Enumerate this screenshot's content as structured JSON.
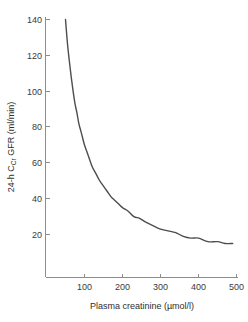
{
  "chart_data": {
    "type": "line",
    "title": "",
    "subtitle": "",
    "xlabel": "Plasma creatinine (µmol/l)",
    "ylabel_parts": {
      "prefix": "24-h C",
      "subscript": "Cr",
      "suffix": " GFR (ml/min)"
    },
    "ylabel": "24-h CCr GFR (ml/min)",
    "xlim": [
      0,
      520
    ],
    "ylim": [
      0,
      148
    ],
    "xticks": [
      100,
      200,
      300,
      400,
      500
    ],
    "xtick_labels": [
      "100",
      "200",
      "300",
      "400",
      "500"
    ],
    "yticks": [
      20,
      40,
      60,
      80,
      100,
      120,
      140
    ],
    "ytick_labels": [
      "20",
      "40",
      "60",
      "80",
      "100",
      "120",
      "140"
    ],
    "grid": false,
    "legend": "none",
    "series": [
      {
        "name": "24-h C_Cr GFR vs plasma creatinine",
        "relation": "GFR = 7000 / plasma creatinine",
        "color": "#4d4d4d",
        "x": [
          50,
          55,
          60,
          65,
          70,
          75,
          80,
          85,
          90,
          95,
          100,
          110,
          120,
          130,
          140,
          150,
          160,
          170,
          180,
          190,
          200,
          215,
          230,
          245,
          260,
          280,
          300,
          320,
          340,
          360,
          380,
          400,
          425,
          450,
          470,
          490
        ],
        "y": [
          140,
          127,
          117,
          108,
          100,
          93,
          88,
          82,
          78,
          74,
          70,
          64,
          58,
          54,
          50,
          47,
          44,
          41,
          39,
          37,
          35,
          33,
          30,
          29,
          27,
          25,
          23,
          22,
          21,
          19,
          18,
          18,
          16,
          16,
          15,
          15
        ]
      }
    ]
  }
}
